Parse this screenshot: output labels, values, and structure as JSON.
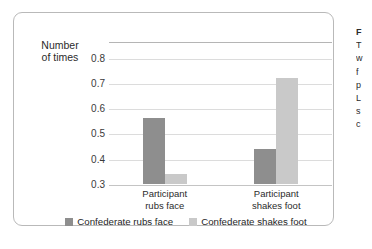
{
  "chart_data": {
    "type": "bar",
    "title": "",
    "xlabel": "",
    "ylabel": "Number of times",
    "ylabel_lines": [
      "Number",
      "of times"
    ],
    "ylim": [
      0.3,
      0.8
    ],
    "ytick_step": 0.1,
    "yticks": [
      "0.8",
      "0.7",
      "0.6",
      "0.5",
      "0.4",
      "0.3"
    ],
    "ytick_values": [
      0.8,
      0.7,
      0.6,
      0.5,
      0.4,
      0.3
    ],
    "grid": "horizontal",
    "legend_position": "bottom-center",
    "categories": [
      "Participant rubs face",
      "Participant shakes foot"
    ],
    "category_lines": [
      [
        "Participant",
        "rubs face"
      ],
      [
        "Participant",
        "shakes foot"
      ]
    ],
    "series": [
      {
        "name": "Confederate rubs face",
        "color": "#8e8e8e",
        "values": [
          0.56,
          0.44
        ]
      },
      {
        "name": "Confederate shakes foot",
        "color": "#c9c9c9",
        "values": [
          0.34,
          0.72
        ]
      }
    ]
  },
  "side_caption": {
    "lines": [
      "F",
      "T",
      "w",
      "f",
      "p",
      "L",
      "s",
      "c"
    ]
  }
}
